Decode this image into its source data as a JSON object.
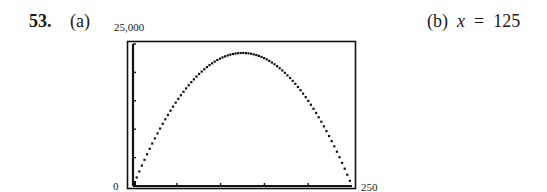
{
  "problem": {
    "number": "53.",
    "part_a_label": "(a)",
    "part_b_label": "(b)",
    "part_b_var": "x",
    "part_b_eq": "=",
    "part_b_value": "125"
  },
  "chart_data": {
    "type": "line",
    "title": "",
    "xlabel": "",
    "ylabel": "",
    "xlim": [
      0,
      250
    ],
    "ylim": [
      0,
      25000
    ],
    "x_tick_labels": {
      "min": "0",
      "max": "250"
    },
    "y_tick_labels": {
      "max": "25,000"
    },
    "x_ticks": [
      0,
      50,
      100,
      150,
      200,
      250
    ],
    "y_ticks": [
      0,
      5000,
      10000,
      15000,
      20000,
      25000
    ],
    "grid": false,
    "legend": null,
    "series": [
      {
        "name": "parabola",
        "style": "dotted-pixel",
        "x": [
          0,
          25,
          50,
          75,
          100,
          125,
          150,
          175,
          200,
          225,
          250
        ],
        "y": [
          0,
          8437.5,
          15000,
          19687.5,
          22500,
          23437.5,
          22500,
          19687.5,
          15000,
          8437.5,
          0
        ]
      }
    ],
    "vertex": {
      "x": 125,
      "y": 23437.5
    }
  }
}
